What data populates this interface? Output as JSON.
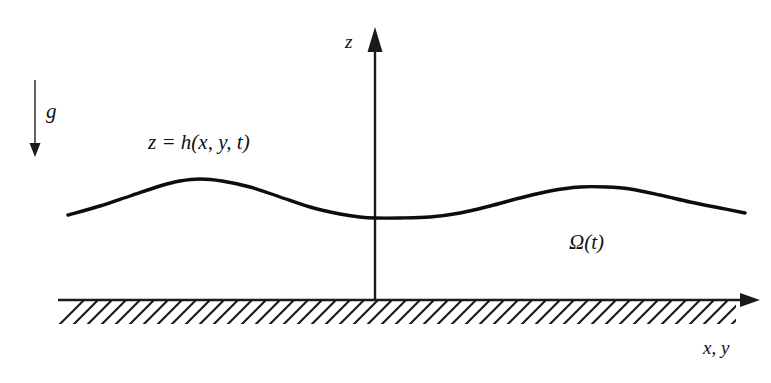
{
  "figure": {
    "background_color": "#ffffff",
    "stroke_color": "#111111",
    "width": 771,
    "height": 383
  },
  "labels": {
    "gravity": "g",
    "vertical_axis": "z",
    "free_surface": "z = h(x, y, t)",
    "domain": "Ω(t)",
    "horizontal_axis": "x, y"
  },
  "icons": {
    "gravity_arrow": "arrow-down-icon",
    "z_axis_arrow": "arrow-up-icon",
    "x_axis_arrow": "arrow-right-icon",
    "hatching": "hatch-pattern-icon"
  },
  "chart_data": {
    "type": "line",
    "title": "z = h(x, y, t)",
    "xlabel": "x, y",
    "ylabel": "z",
    "grid": false,
    "legend": false,
    "annotations": [
      {
        "text": "g",
        "role": "gravity-direction",
        "x": 48,
        "y": 112
      },
      {
        "text": "z = h(x, y, t)",
        "role": "free-surface-label",
        "x": 150,
        "y": 143
      },
      {
        "text": "Ω(t)",
        "role": "fluid-domain-label",
        "x": 571,
        "y": 243
      },
      {
        "text": "z",
        "role": "axis-label",
        "x": 347,
        "y": 41
      },
      {
        "text": "x, y",
        "role": "axis-label",
        "x": 705,
        "y": 347
      }
    ],
    "axes": {
      "origin_px": [
        375,
        300
      ],
      "z_axis": {
        "from_px": [
          375,
          300
        ],
        "to_px": [
          375,
          28
        ],
        "arrow": "up"
      },
      "x_axis": {
        "from_px": [
          58,
          300
        ],
        "to_px": [
          758,
          300
        ],
        "arrow": "right"
      }
    },
    "series": [
      {
        "name": "free surface h(x,y,t)",
        "points_px": [
          [
            68,
            215
          ],
          [
            100,
            206
          ],
          [
            130,
            196
          ],
          [
            160,
            186
          ],
          [
            180,
            181
          ],
          [
            200,
            179
          ],
          [
            222,
            181
          ],
          [
            250,
            187
          ],
          [
            280,
            197
          ],
          [
            310,
            207
          ],
          [
            340,
            214
          ],
          [
            360,
            217
          ],
          [
            375,
            218
          ],
          [
            400,
            218
          ],
          [
            430,
            217
          ],
          [
            460,
            213
          ],
          [
            490,
            206
          ],
          [
            520,
            198
          ],
          [
            550,
            191
          ],
          [
            580,
            187
          ],
          [
            607,
            187
          ],
          [
            630,
            189
          ],
          [
            660,
            195
          ],
          [
            690,
            202
          ],
          [
            720,
            208
          ],
          [
            745,
            213
          ]
        ]
      }
    ],
    "bed": {
      "name": "rigid bottom with hatching",
      "y_px": 300,
      "x_start_px": 58,
      "x_end_px": 736,
      "hatch_depth_px": 22,
      "hatch_angle_deg": 45
    },
    "gravity_vector": {
      "from_px": [
        35,
        80
      ],
      "to_px": [
        35,
        155
      ],
      "direction": "down"
    }
  }
}
